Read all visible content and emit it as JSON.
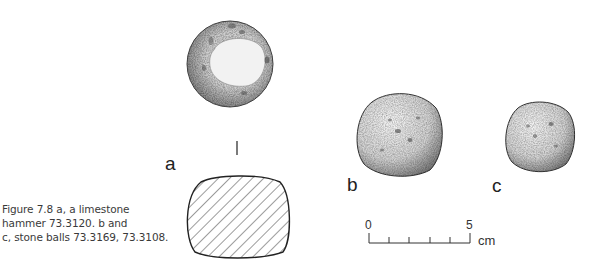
{
  "figure": {
    "caption_lines": [
      "Figure 7.8  a, a limestone",
      "hammer 73.3120. b and",
      "c, stone balls 73.3169, 73.3108."
    ],
    "labels": {
      "a": "a",
      "b": "b",
      "c": "c"
    },
    "objects": [
      {
        "id": "a",
        "description": "limestone hammer",
        "number": "73.3120",
        "views": [
          "plan",
          "section"
        ]
      },
      {
        "id": "b",
        "description": "stone ball",
        "number": "73.3169"
      },
      {
        "id": "c",
        "description": "stone ball",
        "number": "73.3108"
      }
    ],
    "scale_bar": {
      "start_label": "0",
      "end_label": "5",
      "unit": "cm",
      "divisions": 5
    }
  }
}
